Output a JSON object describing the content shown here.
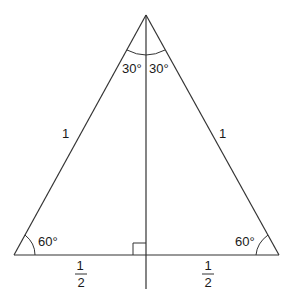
{
  "diagram": {
    "labels": {
      "apex_left_angle": "30°",
      "apex_right_angle": "30°",
      "left_side": "1",
      "right_side": "1",
      "bottom_left_angle": "60°",
      "bottom_right_angle": "60°",
      "left_half_base_num": "1",
      "left_half_base_den": "2",
      "right_half_base_num": "1",
      "right_half_base_den": "2"
    },
    "colors": {
      "stroke": "#333333",
      "text": "#1a1a1a",
      "background": "#ffffff"
    }
  }
}
